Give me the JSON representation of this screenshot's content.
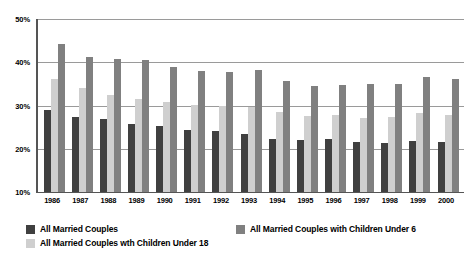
{
  "chart_data": {
    "type": "bar",
    "title": "",
    "subtitle": "",
    "xlabel": "",
    "ylabel": "",
    "ylim": [
      10,
      50
    ],
    "ytick_labels": [
      "50%",
      "40%",
      "30%",
      "20%",
      "10%"
    ],
    "ytick_values": [
      50,
      40,
      30,
      20,
      10
    ],
    "grid": true,
    "legend_position": "bottom",
    "categories": [
      "1986",
      "1987",
      "1988",
      "1989",
      "1990",
      "1991",
      "1992",
      "1993",
      "1994",
      "1995",
      "1996",
      "1997",
      "1998",
      "1999",
      "2000"
    ],
    "series": [
      {
        "name": "All Married Couples",
        "color": "#404040",
        "values": [
          29.0,
          27.4,
          26.8,
          25.8,
          25.2,
          24.4,
          24.0,
          23.4,
          22.2,
          22.0,
          22.2,
          21.6,
          21.4,
          21.8,
          21.6
        ]
      },
      {
        "name": "All Married Couples wth Children Under 18",
        "color": "#cfcfcf",
        "values": [
          36.2,
          34.0,
          32.4,
          31.4,
          30.8,
          30.2,
          29.8,
          29.6,
          28.4,
          27.6,
          27.8,
          27.2,
          27.4,
          28.2,
          27.8
        ]
      },
      {
        "name": "All Married Couples with Children Under 6",
        "color": "#808080",
        "values": [
          44.2,
          41.2,
          40.8,
          40.6,
          39.0,
          38.0,
          37.8,
          38.2,
          35.6,
          34.4,
          34.8,
          35.0,
          35.0,
          36.6,
          36.2
        ]
      }
    ]
  },
  "legend": {
    "entries": [
      {
        "label": "All Married Couples",
        "series": 0
      },
      {
        "label": "All Married Couples wth Children Under 18",
        "series": 1
      },
      {
        "label": "All Married Couples with Children Under 6",
        "series": 2
      }
    ]
  },
  "colors": {
    "series_0": "#404040",
    "series_1": "#cfcfcf",
    "series_2": "#808080",
    "gridline": "#9a9a9a",
    "axis": "#555555",
    "background": "#ffffff"
  }
}
